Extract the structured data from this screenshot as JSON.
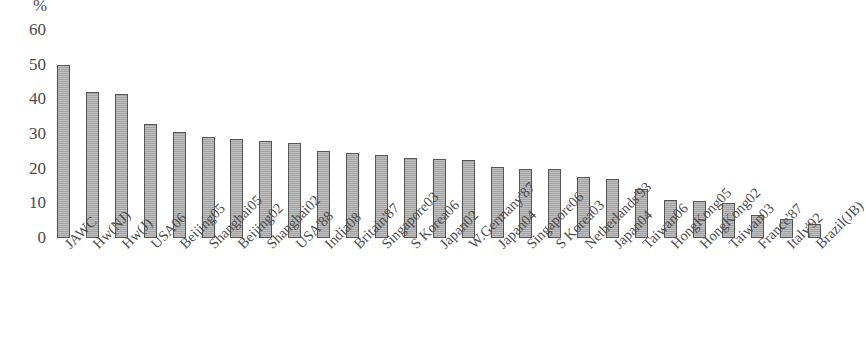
{
  "title_strip": "",
  "axis": {
    "y_unit": "%",
    "y_ticks": [
      60,
      50,
      40,
      30,
      20,
      10,
      0
    ]
  },
  "colors": {
    "bar_fill": "#adadad",
    "bar_border": "#555555",
    "text": "#4a4a4a",
    "background": "#ffffff"
  },
  "chart_data": {
    "type": "bar",
    "title": "",
    "xlabel": "",
    "ylabel": "%",
    "ylim": [
      0,
      60
    ],
    "ytick_step": 10,
    "grid": false,
    "legend": "none",
    "orientation": "vertical",
    "bar_label_rotation": -45,
    "categories": [
      "JAWC",
      "Hw(NJ)",
      "Hw(J)",
      "USA06",
      "Beijing05",
      "Shanghai05",
      "Beijing02",
      "Shanghai02",
      "USA'88",
      "India08",
      "Britain'87",
      "Singapore03",
      "S Korea06",
      "Japan02",
      "W.Germany'87",
      "Japan04",
      "Singapore06",
      "S Korea03",
      "Netherlands'93",
      "Japan04",
      "Taiwan06",
      "HongKong05",
      "HongKong02",
      "Taiwan03",
      "France'87",
      "Italy'92",
      "Brazil(JB)"
    ],
    "values": [
      50,
      42,
      41.5,
      33,
      30.5,
      29,
      28.5,
      28,
      27.5,
      25,
      24.5,
      24,
      23,
      22.8,
      22.5,
      20.5,
      20,
      20,
      17.5,
      17,
      14,
      11,
      10.8,
      10,
      6.5,
      5.5,
      4
    ]
  }
}
